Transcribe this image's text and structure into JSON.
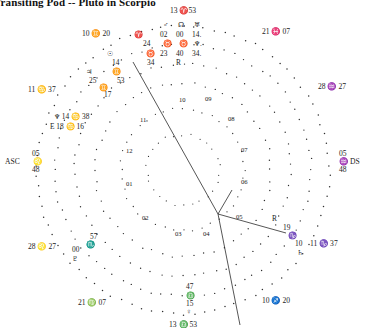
{
  "title": "Transiting Pod -- Pluto in Scorpio",
  "chart": {
    "type": "astrological-wheel",
    "style": "dotted-circle",
    "center": {
      "x": 183,
      "y": 170
    },
    "outer_radius": 148,
    "inner_radius": 96
  },
  "cusp_labels": [
    {
      "name": "cusp-aries",
      "text": "13 ♈53",
      "x": 183,
      "y": 7,
      "align": "c"
    },
    {
      "name": "cusp-pisces",
      "text": "21 ♓ 07",
      "x": 262,
      "y": 28,
      "align": "l"
    },
    {
      "name": "cusp-aquarius",
      "text": "28 ♒ 27",
      "x": 318,
      "y": 83,
      "align": "l"
    },
    {
      "name": "cusp-descendant",
      "text": "05",
      "x": 339,
      "y": 150,
      "align": "l"
    },
    {
      "name": "cusp-descendant-sign",
      "text": "♒ DS",
      "x": 339,
      "y": 158,
      "align": "l"
    },
    {
      "name": "cusp-descendant-min",
      "text": "48",
      "x": 339,
      "y": 166,
      "align": "l"
    },
    {
      "name": "cusp-capricorn",
      "text": "11 ♑ 37",
      "x": 310,
      "y": 240,
      "align": "l"
    },
    {
      "name": "cusp-sagittarius",
      "text": "10 ♐ 20",
      "x": 262,
      "y": 297,
      "align": "l"
    },
    {
      "name": "cusp-libra-bottom",
      "text": "13 ♎ 53",
      "x": 183,
      "y": 321,
      "align": "c"
    },
    {
      "name": "cusp-virgo",
      "text": "21 ♍ 07",
      "x": 78,
      "y": 299,
      "align": "l"
    },
    {
      "name": "cusp-leo",
      "text": "28 ♌ 27",
      "x": 28,
      "y": 243,
      "align": "l"
    },
    {
      "name": "cusp-ascendant-label",
      "text": "ASC",
      "x": 5,
      "y": 158,
      "align": "l"
    },
    {
      "name": "cusp-ascendant",
      "text": "05",
      "x": 32,
      "y": 150,
      "align": "l"
    },
    {
      "name": "cusp-ascendant-sign",
      "text": "♌",
      "x": 33,
      "y": 158,
      "align": "l"
    },
    {
      "name": "cusp-ascendant-min",
      "text": "48",
      "x": 32,
      "y": 166,
      "align": "l"
    },
    {
      "name": "cusp-cancer",
      "text": "11 ♋ 37",
      "x": 28,
      "y": 86,
      "align": "l"
    },
    {
      "name": "cusp-gemini",
      "text": "10 ♊ 20",
      "x": 82,
      "y": 30,
      "align": "l"
    }
  ],
  "house_numbers": [
    {
      "num": "10",
      "x": 179,
      "y": 96
    },
    {
      "num": "09",
      "x": 205,
      "y": 95
    },
    {
      "num": "08",
      "x": 228,
      "y": 115
    },
    {
      "num": "07",
      "x": 241,
      "y": 146
    },
    {
      "num": "06",
      "x": 241,
      "y": 178
    },
    {
      "num": "05",
      "x": 236,
      "y": 213
    },
    {
      "num": "04",
      "x": 203,
      "y": 230
    },
    {
      "num": "03",
      "x": 175,
      "y": 230
    },
    {
      "num": "02",
      "x": 142,
      "y": 214
    },
    {
      "num": "01",
      "x": 126,
      "y": 180
    },
    {
      "num": "12",
      "x": 126,
      "y": 147
    },
    {
      "num": "11",
      "x": 140,
      "y": 116
    }
  ],
  "planets_top_cluster": [
    {
      "name": "mars-glyph",
      "text": "♂",
      "x": 163,
      "y": 21
    },
    {
      "name": "node-glyph",
      "text": "☊",
      "x": 178,
      "y": 21
    },
    {
      "name": "uranus-glyph",
      "text": "♅",
      "x": 194,
      "y": 21
    },
    {
      "name": "aries-sign-1",
      "text": "♈",
      "x": 134,
      "y": 31
    },
    {
      "name": "mars-deg",
      "text": "02",
      "x": 160,
      "y": 31
    },
    {
      "name": "node-deg",
      "text": "00",
      "x": 176,
      "y": 31
    },
    {
      "name": "uranus-deg",
      "text": "14.",
      "x": 192,
      "y": 31
    },
    {
      "name": "aries-min-1",
      "text": "24",
      "x": 143,
      "y": 40
    },
    {
      "name": "taurus-sign-1",
      "text": "♉",
      "x": 163,
      "y": 40
    },
    {
      "name": "taurus-sign-2",
      "text": "♉",
      "x": 179,
      "y": 40
    },
    {
      "name": "neptune-glyph",
      "text": "♆.",
      "x": 194,
      "y": 40
    },
    {
      "name": "sun-glyph",
      "text": "☉",
      "x": 107,
      "y": 50
    },
    {
      "name": "taurus-sign-3",
      "text": "♉",
      "x": 146,
      "y": 50
    },
    {
      "name": "merc-deg",
      "text": "23",
      "x": 160,
      "y": 50
    },
    {
      "name": "venus-deg",
      "text": "40",
      "x": 176,
      "y": 50
    },
    {
      "name": "pluto-deg",
      "text": "34.",
      "x": 192,
      "y": 50
    },
    {
      "name": "sun-deg",
      "text": "14",
      "x": 112,
      "y": 59
    },
    {
      "name": "merc-min",
      "text": "34",
      "x": 147,
      "y": 59
    },
    {
      "name": "retrograde-r",
      "text": "R",
      "x": 176,
      "y": 59
    }
  ],
  "planets_left_cluster": [
    {
      "name": "jupiter-glyph",
      "text": "♃",
      "x": 86,
      "y": 68
    },
    {
      "name": "gemini-sign-1",
      "text": "♊",
      "x": 112,
      "y": 68
    },
    {
      "name": "jupiter-deg",
      "text": "25",
      "x": 89,
      "y": 77
    },
    {
      "name": "gemini-deg",
      "text": "53",
      "x": 117,
      "y": 77
    },
    {
      "name": "gemini-sign-2",
      "text": "♊",
      "x": 99,
      "y": 84
    },
    {
      "name": "gemini-min",
      "text": "17",
      "x": 104,
      "y": 91
    }
  ],
  "planets_cancer_cluster": [
    {
      "name": "neptune-entry",
      "text": "♆ 14 ♋ 38",
      "x": 54,
      "y": 113
    },
    {
      "name": "chiron-entry",
      "text": "E 18 ♋ 16",
      "x": 50,
      "y": 123
    }
  ],
  "planets_scorpio_cluster": [
    {
      "name": "scorpio-min",
      "text": "57",
      "x": 90,
      "y": 233
    },
    {
      "name": "scorpio-sign",
      "text": "♏",
      "x": 86,
      "y": 241
    },
    {
      "name": "scorpio-deg",
      "text": "00",
      "x": 72,
      "y": 246
    },
    {
      "name": "pluto-glyph",
      "text": "♇",
      "x": 72,
      "y": 255
    }
  ],
  "planets_libra_cluster": [
    {
      "name": "libra-min",
      "text": "47",
      "x": 186,
      "y": 283
    },
    {
      "name": "libra-sign",
      "text": "♎",
      "x": 186,
      "y": 292
    },
    {
      "name": "libra-deg",
      "text": "15",
      "x": 186,
      "y": 300
    },
    {
      "name": "venus-glyph",
      "text": "♀",
      "x": 186,
      "y": 308
    }
  ],
  "planets_capricorn_cluster": [
    {
      "name": "retro-mark",
      "text": "R",
      "x": 272,
      "y": 215
    },
    {
      "name": "cap-deg",
      "text": "19",
      "x": 283,
      "y": 224
    },
    {
      "name": "cap-sign",
      "text": "♑",
      "x": 288,
      "y": 232
    },
    {
      "name": "cap-min",
      "text": "10",
      "x": 295,
      "y": 240
    },
    {
      "name": "saturn-glyph",
      "text": "♄",
      "x": 297,
      "y": 249
    }
  ]
}
